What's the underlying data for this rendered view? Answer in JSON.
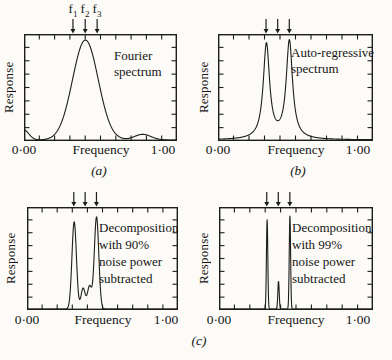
{
  "figure": {
    "background": "#fcfbf7",
    "ink_color": "#1d1d1d",
    "caption_c": "(c)"
  },
  "chart_data": [
    {
      "id": "a",
      "type": "line",
      "panel_label": "(a)",
      "annotation": "Fourier\nspectrum",
      "xlabel": "Frequency",
      "ylabel": "Response",
      "xtick_labels": [
        "0·00",
        "1·00"
      ],
      "xlim": [
        0,
        1
      ],
      "grid": false,
      "f_labels": [
        {
          "base": "f",
          "sub": "1"
        },
        {
          "base": "f",
          "sub": "2"
        },
        {
          "base": "f",
          "sub": "3"
        }
      ],
      "marked_frequencies": [
        0.32,
        0.4,
        0.478
      ],
      "curve_components": [
        {
          "shape": "gauss",
          "center": 0.4,
          "height": 0.97,
          "width": 0.085
        },
        {
          "shape": "gauss",
          "center": -0.01,
          "height": 0.1,
          "width": 0.035
        },
        {
          "shape": "gauss",
          "center": 0.78,
          "height": 0.055,
          "width": 0.055
        }
      ]
    },
    {
      "id": "b",
      "type": "line",
      "panel_label": "(b)",
      "annotation": "Auto-regressive\nspectrum",
      "xlabel": "Frequency",
      "ylabel": "Response",
      "xtick_labels": [
        "0·00",
        "1·00"
      ],
      "xlim": [
        0,
        1
      ],
      "grid": false,
      "marked_frequencies": [
        0.31,
        0.385,
        0.46
      ],
      "curve_components": [
        {
          "shape": "lorentz",
          "center": 0.31,
          "height": 0.92,
          "width": 0.025
        },
        {
          "shape": "lorentz",
          "center": 0.46,
          "height": 0.95,
          "width": 0.025
        }
      ]
    },
    {
      "id": "c90",
      "type": "line",
      "panel_label": "",
      "annotation": "Decomposition\nwith 90%\nnoise power\nsubtracted",
      "xlabel": "Frequency",
      "ylabel": "Response",
      "xtick_labels": [
        "0·00",
        "1·00"
      ],
      "xlim": [
        0,
        1
      ],
      "grid": false,
      "marked_frequencies": [
        0.31,
        0.385,
        0.46
      ],
      "curve_components": [
        {
          "shape": "gauss",
          "center": 0.31,
          "height": 0.88,
          "width": 0.015
        },
        {
          "shape": "gauss",
          "center": 0.46,
          "height": 0.93,
          "width": 0.015
        },
        {
          "shape": "gauss",
          "center": 0.37,
          "height": 0.21,
          "width": 0.014
        },
        {
          "shape": "gauss",
          "center": 0.413,
          "height": 0.23,
          "width": 0.014
        }
      ]
    },
    {
      "id": "c99",
      "type": "line",
      "panel_label": "",
      "annotation": "Decomposition\nwith 99%\nnoise power\nsubtracted",
      "xlabel": "Frequency",
      "ylabel": "Response",
      "xtick_labels": [
        "0·00",
        "1·00"
      ],
      "xlim": [
        0,
        1
      ],
      "grid": false,
      "marked_frequencies": [
        0.31,
        0.385,
        0.46
      ],
      "curve_components": [
        {
          "shape": "gauss",
          "center": 0.31,
          "height": 0.9,
          "width": 0.0045
        },
        {
          "shape": "gauss",
          "center": 0.385,
          "height": 0.28,
          "width": 0.0045
        },
        {
          "shape": "gauss",
          "center": 0.46,
          "height": 0.94,
          "width": 0.0045
        }
      ]
    }
  ]
}
